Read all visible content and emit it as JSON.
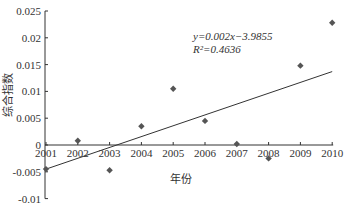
{
  "chart_data": {
    "type": "scatter",
    "title": "",
    "xlabel": "年份",
    "ylabel": "综合指数",
    "x": [
      2001,
      2002,
      2003,
      2004,
      2005,
      2006,
      2007,
      2008,
      2009,
      2010
    ],
    "series": [
      {
        "name": "综合指数",
        "values": [
          -0.0045,
          0.0008,
          -0.0047,
          0.0035,
          0.0105,
          0.0045,
          0.0002,
          -0.0025,
          0.0148,
          0.0228
        ]
      }
    ],
    "trendline": {
      "type": "linear",
      "equation": "y=0.002x−3.9855",
      "r_squared": "R²=0.4636",
      "start": {
        "x": 2001,
        "y": -0.0045
      },
      "end": {
        "x": 2010,
        "y": 0.0137
      }
    },
    "yticks": [
      "0.025",
      "0.02",
      "0.015",
      "0.01",
      "0.005",
      "0",
      "-0.005",
      "-0.01"
    ],
    "ytick_values": [
      0.025,
      0.02,
      0.015,
      0.01,
      0.005,
      0,
      -0.005,
      -0.01
    ],
    "xticks": [
      "2001",
      "2002",
      "2003",
      "2004",
      "2005",
      "2006",
      "2007",
      "2008",
      "2009",
      "2010"
    ],
    "ylim": [
      -0.01,
      0.025
    ],
    "grid": false,
    "legend": "none",
    "colors": {
      "marker": "#555555",
      "line": "#333333",
      "axis": "#333333"
    }
  }
}
